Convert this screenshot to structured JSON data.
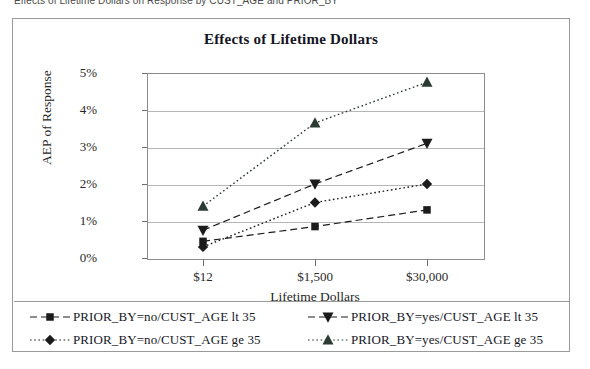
{
  "caption": "Effects of Lifetime Dollars on Response by CUST_AGE and PRIOR_BY",
  "chart_data": {
    "type": "line",
    "title": "Effects of Lifetime Dollars",
    "xlabel": "Lifetime Dollars",
    "ylabel": "AEP of Response",
    "categories": [
      "$12",
      "$1,500",
      "$30,000"
    ],
    "ytick_labels": [
      "0%",
      "1%",
      "2%",
      "3%",
      "4%",
      "5%"
    ],
    "ytick_values": [
      0,
      1,
      2,
      3,
      4,
      5
    ],
    "ylim": [
      0,
      5
    ],
    "grid": true,
    "legend_position": "bottom",
    "series": [
      {
        "name": "PRIOR_BY=no/CUST_AGE lt 35",
        "label": "PRIOR_BY=no/CUST_AGE lt 35",
        "marker": "square",
        "linestyle": "dashed",
        "color": "#1b1b1b",
        "values": [
          0.45,
          0.85,
          1.3
        ]
      },
      {
        "name": "PRIOR_BY=no/CUST_AGE ge 35",
        "label": "PRIOR_BY=no/CUST_AGE ge 35",
        "marker": "diamond",
        "linestyle": "dotted",
        "color": "#1b1b1b",
        "values": [
          0.3,
          1.5,
          2.0
        ]
      },
      {
        "name": "PRIOR_BY=yes/CUST_AGE lt 35",
        "label": "PRIOR_BY=yes/CUST_AGE lt 35",
        "marker": "triangle-down",
        "linestyle": "dashed",
        "color": "#1b1b1b",
        "values": [
          0.75,
          2.0,
          3.1
        ]
      },
      {
        "name": "PRIOR_BY=yes/CUST_AGE ge 35",
        "label": "PRIOR_BY=yes/CUST_AGE ge 35",
        "marker": "triangle-up",
        "linestyle": "dotted",
        "color": "#2b3b33",
        "values": [
          1.4,
          3.65,
          4.75
        ]
      }
    ]
  }
}
